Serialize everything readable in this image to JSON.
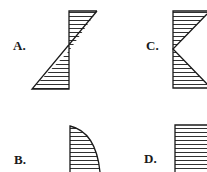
{
  "options": [
    {
      "id": "A",
      "label": "A.",
      "shape": "antisymmetric-triangles",
      "description": "Hatched triangle on right of vertical axis at top, tapering to zero at mid-height, then hatched triangle on left at bottom"
    },
    {
      "id": "B",
      "label": "B.",
      "shape": "parabolic",
      "description": "Hatched region to right of vertical axis bounded by a convex curve, zero at top growing to maximum at bottom"
    },
    {
      "id": "C",
      "label": "C.",
      "shape": "symmetric-triangles",
      "description": "Hatched triangles to right of vertical axis, maximum at top and bottom, zero at mid-height"
    },
    {
      "id": "D",
      "label": "D.",
      "shape": "uniform",
      "description": "Hatched rectangle to right of vertical axis, uniform distribution"
    }
  ],
  "colors": {
    "stroke": "#1a1a1a",
    "background": "#ffffff"
  }
}
